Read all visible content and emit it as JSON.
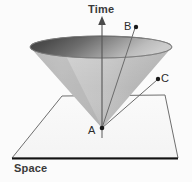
{
  "diagram": {
    "type": "light-cone-spacetime-diagram",
    "axes": {
      "time_label": "Time",
      "space_label": "Space"
    },
    "points": [
      {
        "id": "A",
        "label": "A",
        "role": "cone-apex-observer-here-now",
        "x": 102,
        "y": 128
      },
      {
        "id": "B",
        "label": "B",
        "role": "event-inside-future-light-cone",
        "x": 136,
        "y": 27
      },
      {
        "id": "C",
        "label": "C",
        "role": "event-outside-light-cone",
        "x": 158,
        "y": 79
      }
    ],
    "worldlines": [
      {
        "from": "A",
        "to": "B"
      },
      {
        "from": "A",
        "to": "C"
      }
    ],
    "cone": {
      "apex": {
        "x": 102,
        "y": 128
      },
      "rim_ellipse": {
        "cx": 101,
        "cy": 47,
        "rx": 71,
        "ry": 11
      },
      "surface_shading": "left-dark-to-right-light-gray",
      "interior_shading": "dark-gray-left-to-mid-gray-right"
    },
    "plane": {
      "shape": "trapezoid",
      "corners": [
        {
          "x": 62,
          "y": 96
        },
        {
          "x": 165,
          "y": 95
        },
        {
          "x": 178,
          "y": 158
        },
        {
          "x": 12,
          "y": 158
        }
      ],
      "baseline_emphasis": "thick-black-bottom-edge"
    },
    "colors": {
      "background": "#fbfbfb",
      "outline": "#6a6a6a",
      "baseline": "#111111",
      "cone_light": "#cfcfcf",
      "cone_mid": "#b3b3b3",
      "cone_dark": "#5c5c5c",
      "interior_dark": "#4a4a4a",
      "label_text": "#3a3a3a",
      "axis_line": "#555555",
      "point_dot": "#1a1a1a"
    }
  }
}
